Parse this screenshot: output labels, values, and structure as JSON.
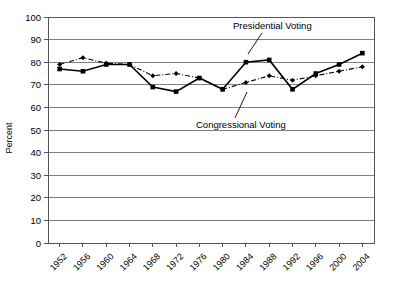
{
  "chart_data": {
    "type": "line",
    "title": "",
    "xlabel": "",
    "ylabel": "Percent",
    "ylim": [
      0,
      100
    ],
    "ytick_step": 10,
    "yticks": [
      0,
      10,
      20,
      30,
      40,
      50,
      60,
      70,
      80,
      90,
      100
    ],
    "grid": true,
    "legend_position": "annotations-inline",
    "categories": [
      "1952",
      "1956",
      "1960",
      "1964",
      "1968",
      "1972",
      "1976",
      "1980",
      "1984",
      "1988",
      "1992",
      "1996",
      "2000",
      "2004"
    ],
    "series": [
      {
        "name": "Presidential Voting",
        "style": "solid-square",
        "values": [
          77,
          76,
          79,
          79,
          69,
          67,
          73,
          68,
          80,
          81,
          68,
          75,
          79,
          84
        ]
      },
      {
        "name": "Congressional Voting",
        "style": "dash-dot-diamond",
        "values": [
          79,
          82,
          79.5,
          79,
          74,
          75,
          73,
          68,
          71,
          74,
          72,
          74,
          76,
          78
        ]
      }
    ],
    "annotations": [
      {
        "text": "Presidential Voting",
        "target_category": "1984",
        "target_series": "Presidential Voting"
      },
      {
        "text": "Congressional Voting",
        "target_category": "1984",
        "target_series": "Congressional Voting"
      }
    ]
  },
  "axis": {
    "y_title": "Percent",
    "y_labels": [
      "100",
      "90",
      "80",
      "70",
      "60",
      "50",
      "40",
      "30",
      "20",
      "10",
      "0"
    ],
    "x_labels": [
      "1952",
      "1956",
      "1960",
      "1964",
      "1968",
      "1972",
      "1976",
      "1980",
      "1984",
      "1988",
      "1992",
      "1996",
      "2000",
      "2004"
    ]
  },
  "annotations": {
    "presidential_label": "Presidential Voting",
    "congressional_label": "Congressional Voting"
  },
  "colors": {
    "series_line": "#000000",
    "gridline": "#808080",
    "axis": "#555555",
    "background": "#ffffff",
    "text": "#000000"
  }
}
